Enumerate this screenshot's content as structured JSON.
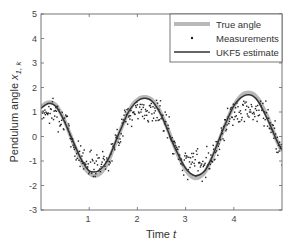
{
  "chart_data": {
    "type": "line",
    "title": "",
    "xlabel": "Time",
    "xlabel_italic_var": "t",
    "ylabel": "Pendulum angle",
    "ylabel_var": "x",
    "ylabel_sub": "1, k",
    "xlim": [
      0,
      5
    ],
    "ylim": [
      -3,
      5
    ],
    "xticks": [
      1,
      2,
      3,
      4
    ],
    "yticks": [
      -3,
      -2,
      -1,
      0,
      1,
      2,
      3,
      4,
      5
    ],
    "grid": false,
    "legend_position": "upper right",
    "series": [
      {
        "name": "True angle",
        "style": "thick light gray line",
        "color": "#b8b8b8",
        "x": [
          0.0,
          0.1,
          0.2,
          0.3,
          0.4,
          0.5,
          0.6,
          0.7,
          0.8,
          0.9,
          1.0,
          1.1,
          1.2,
          1.3,
          1.4,
          1.5,
          1.6,
          1.7,
          1.8,
          1.9,
          2.0,
          2.1,
          2.2,
          2.3,
          2.4,
          2.5,
          2.6,
          2.7,
          2.8,
          2.9,
          3.0,
          3.1,
          3.2,
          3.3,
          3.4,
          3.5,
          3.6,
          3.7,
          3.8,
          3.9,
          4.0,
          4.1,
          4.2,
          4.3,
          4.4,
          4.5,
          4.6,
          4.7,
          4.8,
          4.9,
          5.0
        ],
        "y": [
          1.2,
          1.35,
          1.4,
          1.3,
          1.0,
          0.6,
          0.1,
          -0.4,
          -0.85,
          -1.25,
          -1.5,
          -1.6,
          -1.55,
          -1.35,
          -1.0,
          -0.5,
          0.0,
          0.5,
          0.95,
          1.3,
          1.5,
          1.6,
          1.6,
          1.5,
          1.25,
          0.9,
          0.45,
          -0.05,
          -0.55,
          -1.0,
          -1.35,
          -1.6,
          -1.7,
          -1.65,
          -1.45,
          -1.1,
          -0.65,
          -0.15,
          0.35,
          0.85,
          1.25,
          1.55,
          1.75,
          1.8,
          1.75,
          1.55,
          1.2,
          0.8,
          0.3,
          -0.2,
          -0.6
        ]
      },
      {
        "name": "Measurements",
        "style": "dots",
        "color": "#222222"
      },
      {
        "name": "UKF5 estimate",
        "style": "solid dark line",
        "color": "#333333",
        "x": [
          0.0,
          0.1,
          0.2,
          0.3,
          0.4,
          0.5,
          0.6,
          0.7,
          0.8,
          0.9,
          1.0,
          1.1,
          1.2,
          1.3,
          1.4,
          1.5,
          1.6,
          1.7,
          1.8,
          1.9,
          2.0,
          2.1,
          2.2,
          2.3,
          2.4,
          2.5,
          2.6,
          2.7,
          2.8,
          2.9,
          3.0,
          3.1,
          3.2,
          3.3,
          3.4,
          3.5,
          3.6,
          3.7,
          3.8,
          3.9,
          4.0,
          4.1,
          4.2,
          4.3,
          4.4,
          4.5,
          4.6,
          4.7,
          4.8,
          4.9,
          5.0
        ],
        "y": [
          1.15,
          1.3,
          1.35,
          1.25,
          0.95,
          0.55,
          0.1,
          -0.35,
          -0.8,
          -1.15,
          -1.4,
          -1.45,
          -1.4,
          -1.2,
          -0.9,
          -0.45,
          0.05,
          0.5,
          0.95,
          1.25,
          1.45,
          1.55,
          1.55,
          1.45,
          1.2,
          0.85,
          0.4,
          -0.1,
          -0.55,
          -0.95,
          -1.3,
          -1.5,
          -1.6,
          -1.55,
          -1.4,
          -1.05,
          -0.6,
          -0.1,
          0.4,
          0.85,
          1.25,
          1.5,
          1.65,
          1.7,
          1.65,
          1.45,
          1.1,
          0.7,
          0.25,
          -0.2,
          -0.55
        ]
      }
    ]
  },
  "legend": {
    "items": [
      {
        "label": "True angle"
      },
      {
        "label": "Measurements"
      },
      {
        "label": "UKF5 estimate"
      }
    ]
  },
  "axes": {
    "x_tick_labels": [
      "1",
      "2",
      "3",
      "4"
    ],
    "y_tick_labels": [
      "-3",
      "-2",
      "-1",
      "0",
      "1",
      "2",
      "3",
      "4",
      "5"
    ],
    "xlabel_text": "Time",
    "xlabel_var": "t",
    "ylabel_text": "Pendulum angle ",
    "ylabel_var": "x",
    "ylabel_sub": "1, k"
  }
}
